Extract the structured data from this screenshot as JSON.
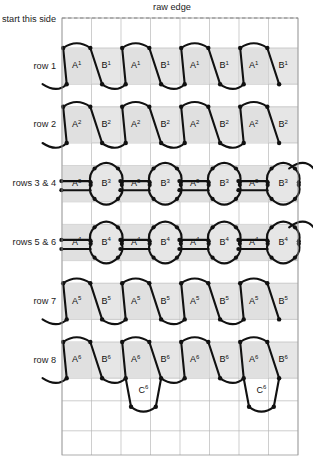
{
  "diagram": {
    "title_top": "raw edge",
    "start_label": "start this side",
    "type": "knitting-stitch-chart",
    "grid": {
      "columns": 8,
      "rows": 12,
      "left": 62,
      "top": 18,
      "right": 298,
      "bottom": 455,
      "col_width": 29.5,
      "row_height": 36.4
    },
    "colors": {
      "band_shade": "#e2e2e2",
      "cell_shade": "#e0e0e0",
      "stitch_stroke": "#111111",
      "gridline": "#b9b9b9",
      "frame": "#9a9a9a",
      "raw_edge_dash": "#7d7d7d",
      "background": "#ffffff"
    },
    "row_labels": [
      {
        "id": "row-1",
        "text": "row 1"
      },
      {
        "id": "row-2",
        "text": "row 2"
      },
      {
        "id": "rows-3-4",
        "text": "rows 3 & 4"
      },
      {
        "id": "rows-5-6",
        "text": "rows 5 & 6"
      },
      {
        "id": "row-7",
        "text": "row 7"
      },
      {
        "id": "row-8",
        "text": "row 8"
      }
    ],
    "bands": [
      {
        "id": "row-1",
        "label": "row 1",
        "style": "trapezoid",
        "cells": [
          {
            "letter": "A",
            "sup": "1",
            "kind": "A",
            "shaded": true
          },
          {
            "letter": "B",
            "sup": "1",
            "kind": "B",
            "shaded": false
          },
          {
            "letter": "A",
            "sup": "1",
            "kind": "A",
            "shaded": true
          },
          {
            "letter": "B",
            "sup": "1",
            "kind": "B",
            "shaded": false
          },
          {
            "letter": "A",
            "sup": "1",
            "kind": "A",
            "shaded": true
          },
          {
            "letter": "B",
            "sup": "1",
            "kind": "B",
            "shaded": false
          },
          {
            "letter": "A",
            "sup": "1",
            "kind": "A",
            "shaded": true
          },
          {
            "letter": "B",
            "sup": "1",
            "kind": "B",
            "shaded": false
          }
        ]
      },
      {
        "id": "row-2",
        "label": "row 2",
        "style": "trapezoid",
        "cells": [
          {
            "letter": "A",
            "sup": "2",
            "kind": "A",
            "shaded": true
          },
          {
            "letter": "B",
            "sup": "2",
            "kind": "B",
            "shaded": false
          },
          {
            "letter": "A",
            "sup": "2",
            "kind": "A",
            "shaded": true
          },
          {
            "letter": "B",
            "sup": "2",
            "kind": "B",
            "shaded": false
          },
          {
            "letter": "A",
            "sup": "2",
            "kind": "A",
            "shaded": true
          },
          {
            "letter": "B",
            "sup": "2",
            "kind": "B",
            "shaded": false
          },
          {
            "letter": "A",
            "sup": "2",
            "kind": "A",
            "shaded": true
          },
          {
            "letter": "B",
            "sup": "2",
            "kind": "B",
            "shaded": false
          }
        ]
      },
      {
        "id": "rows-3-4",
        "label": "rows 3 & 4",
        "style": "round",
        "cells": [
          {
            "letter": "A",
            "sup": "3",
            "kind": "A",
            "shaded": true
          },
          {
            "letter": "B",
            "sup": "3",
            "kind": "B",
            "shaded": false
          },
          {
            "letter": "A",
            "sup": "3",
            "kind": "A",
            "shaded": true
          },
          {
            "letter": "B",
            "sup": "3",
            "kind": "B",
            "shaded": false
          },
          {
            "letter": "A",
            "sup": "3",
            "kind": "A",
            "shaded": true
          },
          {
            "letter": "B",
            "sup": "3",
            "kind": "B",
            "shaded": false
          },
          {
            "letter": "A",
            "sup": "3",
            "kind": "A",
            "shaded": true
          },
          {
            "letter": "B",
            "sup": "3",
            "kind": "B",
            "shaded": false
          }
        ]
      },
      {
        "id": "rows-5-6",
        "label": "rows 5 & 6",
        "style": "round",
        "cells": [
          {
            "letter": "A",
            "sup": "4",
            "kind": "A",
            "shaded": true
          },
          {
            "letter": "B",
            "sup": "4",
            "kind": "B",
            "shaded": false
          },
          {
            "letter": "A",
            "sup": "4",
            "kind": "A",
            "shaded": true
          },
          {
            "letter": "B",
            "sup": "4",
            "kind": "B",
            "shaded": false
          },
          {
            "letter": "A",
            "sup": "4",
            "kind": "A",
            "shaded": true
          },
          {
            "letter": "B",
            "sup": "4",
            "kind": "B",
            "shaded": false
          },
          {
            "letter": "A",
            "sup": "4",
            "kind": "A",
            "shaded": true
          },
          {
            "letter": "B",
            "sup": "4",
            "kind": "B",
            "shaded": false
          }
        ]
      },
      {
        "id": "row-7",
        "label": "row 7",
        "style": "trapezoid",
        "cells": [
          {
            "letter": "A",
            "sup": "5",
            "kind": "A",
            "shaded": true
          },
          {
            "letter": "B",
            "sup": "5",
            "kind": "B",
            "shaded": false
          },
          {
            "letter": "A",
            "sup": "5",
            "kind": "A",
            "shaded": true
          },
          {
            "letter": "B",
            "sup": "5",
            "kind": "B",
            "shaded": false
          },
          {
            "letter": "A",
            "sup": "5",
            "kind": "A",
            "shaded": true
          },
          {
            "letter": "B",
            "sup": "5",
            "kind": "B",
            "shaded": false
          },
          {
            "letter": "A",
            "sup": "5",
            "kind": "A",
            "shaded": true
          },
          {
            "letter": "B",
            "sup": "5",
            "kind": "B",
            "shaded": false
          }
        ]
      },
      {
        "id": "row-8",
        "label": "row 8",
        "style": "trapezoid",
        "cells": [
          {
            "letter": "A",
            "sup": "6",
            "kind": "A",
            "shaded": true
          },
          {
            "letter": "B",
            "sup": "6",
            "kind": "B",
            "shaded": false
          },
          {
            "letter": "A",
            "sup": "6",
            "kind": "A",
            "shaded": true
          },
          {
            "letter": "B",
            "sup": "6",
            "kind": "B",
            "shaded": false
          },
          {
            "letter": "A",
            "sup": "6",
            "kind": "A",
            "shaded": true
          },
          {
            "letter": "B",
            "sup": "6",
            "kind": "B",
            "shaded": false
          },
          {
            "letter": "A",
            "sup": "6",
            "kind": "A",
            "shaded": true
          },
          {
            "letter": "B",
            "sup": "6",
            "kind": "B",
            "shaded": false
          }
        ]
      }
    ],
    "tail_cells": [
      {
        "letter": "C",
        "sup": "6",
        "column": 2
      },
      {
        "letter": "C",
        "sup": "6",
        "column": 6
      }
    ]
  }
}
